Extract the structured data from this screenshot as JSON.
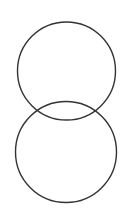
{
  "canvas": {
    "width": 131,
    "height": 214,
    "background": "#ffffff"
  },
  "shapes": [
    {
      "type": "circle",
      "cx": 66.5,
      "cy": 71,
      "r": 49,
      "stroke": "#333333",
      "stroke_width": 1.4
    },
    {
      "type": "circle",
      "cx": 66,
      "cy": 152,
      "r": 50.5,
      "stroke": "#333333",
      "stroke_width": 1.4
    }
  ]
}
